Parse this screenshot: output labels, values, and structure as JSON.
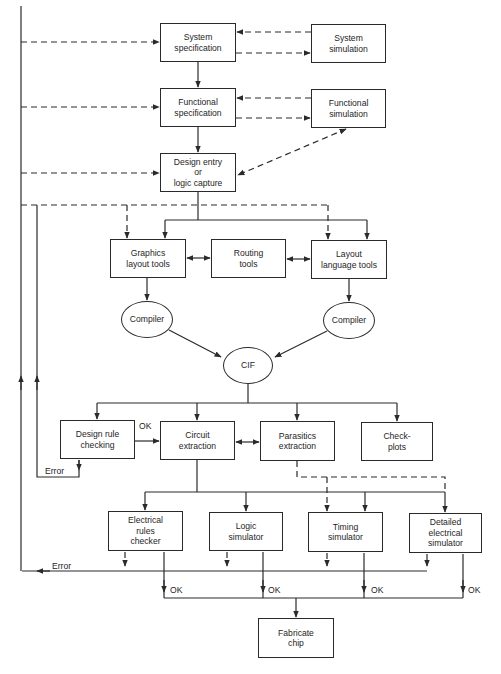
{
  "diagram": {
    "type": "flowchart",
    "nodes": [
      {
        "id": "system_spec",
        "label": "System\nspecification",
        "shape": "rect",
        "x": 160,
        "y": 23,
        "w": 76,
        "h": 39
      },
      {
        "id": "system_sim",
        "label": "System\nsimulation",
        "shape": "rect",
        "x": 311,
        "y": 24,
        "w": 75,
        "h": 39
      },
      {
        "id": "functional_spec",
        "label": "Functional\nspecification",
        "shape": "rect",
        "x": 160,
        "y": 88,
        "w": 76,
        "h": 39
      },
      {
        "id": "functional_sim",
        "label": "Functional\nsimulation",
        "shape": "rect",
        "x": 311,
        "y": 89,
        "w": 75,
        "h": 39
      },
      {
        "id": "design_entry",
        "label": "Design entry\nor\nlogic capture",
        "shape": "rect",
        "x": 160,
        "y": 153,
        "w": 76,
        "h": 39
      },
      {
        "id": "graphics_layout",
        "label": "Graphics\nlayout tools",
        "shape": "rect",
        "x": 110,
        "y": 239,
        "w": 76,
        "h": 39
      },
      {
        "id": "routing_tools",
        "label": "Routing\ntools",
        "shape": "rect",
        "x": 211,
        "y": 239,
        "w": 75,
        "h": 39
      },
      {
        "id": "layout_language",
        "label": "Layout\nlanguage tools",
        "shape": "rect",
        "x": 311,
        "y": 240,
        "w": 76,
        "h": 39
      },
      {
        "id": "compiler_left",
        "label": "Compiler",
        "shape": "ellipse",
        "x": 121,
        "y": 301,
        "w": 52,
        "h": 37
      },
      {
        "id": "compiler_right",
        "label": "Compiler",
        "shape": "ellipse",
        "x": 323,
        "y": 302,
        "w": 52,
        "h": 37
      },
      {
        "id": "cif",
        "label": "CIF",
        "shape": "ellipse",
        "x": 223,
        "y": 347,
        "w": 50,
        "h": 37
      },
      {
        "id": "design_rule_checking",
        "label": "Design rule\nchecking",
        "shape": "rect",
        "x": 60,
        "y": 420,
        "w": 75,
        "h": 39
      },
      {
        "id": "circuit_extraction",
        "label": "Circuit\nextraction",
        "shape": "rect",
        "x": 160,
        "y": 421,
        "w": 75,
        "h": 39
      },
      {
        "id": "parasitics_extraction",
        "label": "Parasitics\nextraction",
        "shape": "rect",
        "x": 260,
        "y": 421,
        "w": 75,
        "h": 40
      },
      {
        "id": "check_plots",
        "label": "Check-\nplots",
        "shape": "rect",
        "x": 361,
        "y": 422,
        "w": 72,
        "h": 39
      },
      {
        "id": "electrical_rules_checker",
        "label": "Electrical\nrules\nchecker",
        "shape": "rect",
        "x": 108,
        "y": 511,
        "w": 75,
        "h": 40
      },
      {
        "id": "logic_simulator",
        "label": "Logic\nsimulator",
        "shape": "rect",
        "x": 209,
        "y": 512,
        "w": 74,
        "h": 39
      },
      {
        "id": "timing_simulator",
        "label": "Timing\nsimulator",
        "shape": "rect",
        "x": 308,
        "y": 512,
        "w": 75,
        "h": 40
      },
      {
        "id": "detailed_electrical_simulator",
        "label": "Detailed\nelectrical\nsimulator",
        "shape": "rect",
        "x": 409,
        "y": 513,
        "w": 73,
        "h": 40
      },
      {
        "id": "fabricate_chip",
        "label": "Fabricate\nchip",
        "shape": "rect",
        "x": 258,
        "y": 618,
        "w": 76,
        "h": 40
      }
    ],
    "edge_labels": [
      {
        "id": "ok_drc",
        "text": "OK",
        "x": 139,
        "y": 421
      },
      {
        "id": "error_drc",
        "text": "Error",
        "x": 45,
        "y": 466
      },
      {
        "id": "error_sims",
        "text": "Error",
        "x": 52,
        "y": 561
      },
      {
        "id": "ok_erc",
        "text": "OK",
        "x": 170,
        "y": 585
      },
      {
        "id": "ok_logic",
        "text": "OK",
        "x": 268,
        "y": 585
      },
      {
        "id": "ok_timing",
        "text": "OK",
        "x": 371,
        "y": 585
      },
      {
        "id": "ok_detailed",
        "text": "OK",
        "x": 468,
        "y": 585
      }
    ],
    "edges": [
      {
        "from": "system_spec",
        "to": "functional_spec",
        "style": "solid"
      },
      {
        "from": "functional_spec",
        "to": "design_entry",
        "style": "solid"
      },
      {
        "from": "system_spec",
        "to": "system_sim",
        "style": "dashed"
      },
      {
        "from": "system_sim",
        "to": "system_spec",
        "style": "dashed"
      },
      {
        "from": "functional_spec",
        "to": "functional_sim",
        "style": "dashed"
      },
      {
        "from": "functional_sim",
        "to": "functional_spec",
        "style": "dashed"
      },
      {
        "from": "functional_sim",
        "to": "design_entry",
        "style": "dashed",
        "bidirectional": true
      },
      {
        "from": "design_entry",
        "to": "graphics_layout",
        "style": "solid"
      },
      {
        "from": "design_entry",
        "to": "layout_language",
        "style": "solid"
      },
      {
        "from": "graphics_layout",
        "to": "routing_tools",
        "style": "solid",
        "bidirectional": true
      },
      {
        "from": "routing_tools",
        "to": "layout_language",
        "style": "solid",
        "bidirectional": true
      },
      {
        "from": "graphics_layout",
        "to": "compiler_left",
        "style": "solid"
      },
      {
        "from": "layout_language",
        "to": "compiler_right",
        "style": "solid"
      },
      {
        "from": "compiler_left",
        "to": "cif",
        "style": "solid"
      },
      {
        "from": "compiler_right",
        "to": "cif",
        "style": "solid"
      },
      {
        "from": "cif",
        "to": "design_rule_checking",
        "style": "solid"
      },
      {
        "from": "cif",
        "to": "circuit_extraction",
        "style": "solid"
      },
      {
        "from": "cif",
        "to": "parasitics_extraction",
        "style": "solid"
      },
      {
        "from": "cif",
        "to": "check_plots",
        "style": "solid"
      },
      {
        "from": "design_rule_checking",
        "to": "circuit_extraction",
        "style": "solid",
        "label": "OK"
      },
      {
        "from": "design_rule_checking",
        "to": "feedback_inner",
        "style": "solid",
        "label": "Error"
      },
      {
        "from": "circuit_extraction",
        "to": "parasitics_extraction",
        "style": "solid",
        "bidirectional": true
      },
      {
        "from": "circuit_extraction",
        "to": "electrical_rules_checker",
        "style": "solid"
      },
      {
        "from": "circuit_extraction",
        "to": "logic_simulator",
        "style": "solid"
      },
      {
        "from": "circuit_extraction",
        "to": "timing_simulator",
        "style": "solid"
      },
      {
        "from": "circuit_extraction",
        "to": "detailed_electrical_simulator",
        "style": "solid"
      },
      {
        "from": "parasitics_extraction",
        "to": "timing_simulator",
        "style": "dashed"
      },
      {
        "from": "parasitics_extraction",
        "to": "detailed_electrical_simulator",
        "style": "dashed"
      },
      {
        "from": "electrical_rules_checker",
        "to": "fabricate_chip",
        "style": "solid",
        "label": "OK"
      },
      {
        "from": "logic_simulator",
        "to": "fabricate_chip",
        "style": "solid",
        "label": "OK"
      },
      {
        "from": "timing_simulator",
        "to": "fabricate_chip",
        "style": "solid",
        "label": "OK"
      },
      {
        "from": "detailed_electrical_simulator",
        "to": "fabricate_chip",
        "style": "solid",
        "label": "OK"
      },
      {
        "from": "simulators",
        "to": "feedback_outer",
        "style": "solid",
        "label": "Error"
      },
      {
        "from": "feedback_outer",
        "to": "system_spec",
        "style": "dashed"
      },
      {
        "from": "feedback_outer",
        "to": "functional_spec",
        "style": "dashed"
      },
      {
        "from": "feedback_outer",
        "to": "design_entry",
        "style": "dashed"
      },
      {
        "from": "feedback_outer",
        "to": "graphics_layout",
        "style": "dashed"
      },
      {
        "from": "feedback_outer",
        "to": "layout_language",
        "style": "dashed"
      }
    ]
  }
}
